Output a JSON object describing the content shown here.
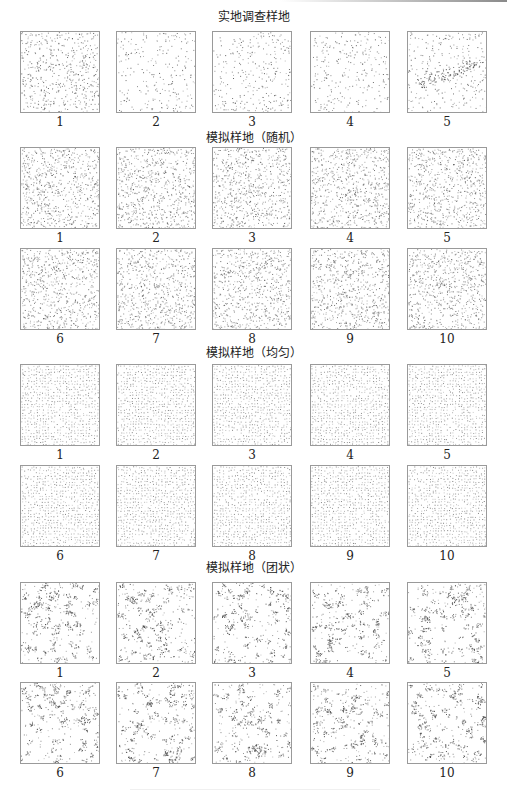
{
  "chart_data": {
    "type": "scatter",
    "sections": [
      {
        "title": "实地调查样地",
        "pattern": "field",
        "plots": [
          {
            "label": "1",
            "density": 1.0,
            "note": "dense random"
          },
          {
            "label": "2",
            "density": 0.45,
            "note": "sparse"
          },
          {
            "label": "3",
            "density": 0.55,
            "note": "sparse"
          },
          {
            "label": "4",
            "density": 0.5,
            "note": "sparse"
          },
          {
            "label": "5",
            "density": 0.5,
            "note": "clustered band across middle"
          }
        ]
      },
      {
        "title": "模拟样地（随机）",
        "pattern": "random",
        "plots": [
          {
            "label": "1"
          },
          {
            "label": "2"
          },
          {
            "label": "3"
          },
          {
            "label": "4"
          },
          {
            "label": "5"
          },
          {
            "label": "6"
          },
          {
            "label": "7"
          },
          {
            "label": "8"
          },
          {
            "label": "9"
          },
          {
            "label": "10"
          }
        ]
      },
      {
        "title": "模拟样地（均匀）",
        "pattern": "uniform",
        "plots": [
          {
            "label": "1"
          },
          {
            "label": "2"
          },
          {
            "label": "3"
          },
          {
            "label": "4"
          },
          {
            "label": "5"
          },
          {
            "label": "6"
          },
          {
            "label": "7"
          },
          {
            "label": "8"
          },
          {
            "label": "9"
          },
          {
            "label": "10"
          }
        ]
      },
      {
        "title": "模拟样地（团状）",
        "pattern": "clustered",
        "plots": [
          {
            "label": "1"
          },
          {
            "label": "2"
          },
          {
            "label": "3"
          },
          {
            "label": "4"
          },
          {
            "label": "5"
          },
          {
            "label": "6"
          },
          {
            "label": "7"
          },
          {
            "label": "8"
          },
          {
            "label": "9"
          },
          {
            "label": "10"
          }
        ]
      }
    ],
    "layout": {
      "columns": 5,
      "grid": false,
      "axes": false,
      "legend": "none"
    }
  },
  "colors": {
    "border": "#9a9a9a",
    "dot": "#555555",
    "text": "#222222"
  }
}
